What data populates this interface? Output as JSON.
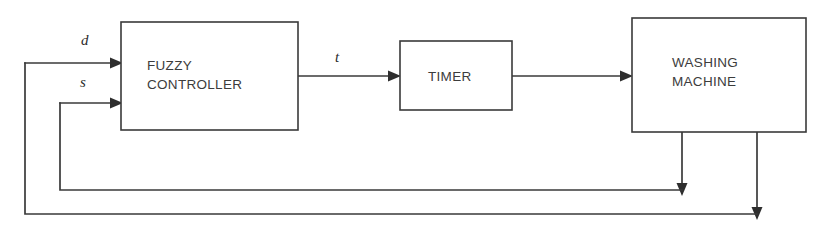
{
  "diagram": {
    "type": "block-diagram",
    "background_color": "#ffffff",
    "line_color": "#3a3a3a",
    "text_color": "#3c3c3c",
    "blocks": [
      {
        "id": "fuzzy-controller",
        "label_line_1": "FUZZY",
        "label_line_2": "CONTROLLER",
        "x": 121,
        "y": 22,
        "width": 177,
        "height": 108
      },
      {
        "id": "timer",
        "label_line_1": "TIMER",
        "label_line_2": "",
        "x": 400,
        "y": 41,
        "width": 112,
        "height": 69
      },
      {
        "id": "washing-machine",
        "label_line_1": "WASHING",
        "label_line_2": "MACHINE",
        "x": 632,
        "y": 18,
        "width": 174,
        "height": 114
      }
    ],
    "signals": [
      {
        "id": "d",
        "label": "d",
        "description": "dirtiness input",
        "x": 86,
        "y": 45
      },
      {
        "id": "s",
        "label": "s",
        "description": "soil type input",
        "x": 85,
        "y": 87
      },
      {
        "id": "t",
        "label": "t",
        "description": "wash time output",
        "x": 338,
        "y": 62
      }
    ],
    "connections": [
      {
        "from": "feedback-outer",
        "to": "fuzzy-controller",
        "signal": "d",
        "arrow": "right"
      },
      {
        "from": "feedback-inner",
        "to": "fuzzy-controller",
        "signal": "s",
        "arrow": "right"
      },
      {
        "from": "fuzzy-controller",
        "to": "timer",
        "signal": "t",
        "arrow": "right"
      },
      {
        "from": "timer",
        "to": "washing-machine",
        "signal": "",
        "arrow": "right"
      },
      {
        "from": "washing-machine",
        "to": "feedback-inner",
        "signal": "",
        "arrow": "down"
      },
      {
        "from": "washing-machine",
        "to": "feedback-outer",
        "signal": "",
        "arrow": "down"
      }
    ],
    "feedback_loops": [
      {
        "id": "feedback-inner",
        "tap_x": 682,
        "rail_y": 190,
        "return_x": 60,
        "enters_at_y": 103
      },
      {
        "id": "feedback-outer",
        "tap_x": 757,
        "rail_y": 214,
        "return_x": 25,
        "enters_at_y": 63
      }
    ]
  }
}
